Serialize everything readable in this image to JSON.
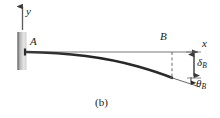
{
  "figure": {
    "caption": "(b)",
    "type": "engineering-beam-deflection-diagram",
    "colors": {
      "beam": "#2b2b2b",
      "axis": "#4d4d4d",
      "wall_dark": "#8c8c8c",
      "wall_light": "#e2e2e2",
      "text": "#1a1a1a",
      "background": "#ffffff"
    },
    "labels": {
      "y_axis": "y",
      "x_axis": "x",
      "point_a": "A",
      "point_b": "B",
      "deflection_symbol": "δ",
      "deflection_subscript": "B",
      "slope_symbol": "θ",
      "slope_subscript": "B"
    },
    "geometry": {
      "wall_x": 22,
      "beam_start_x": 26,
      "beam_start_y": 52,
      "beam_end_x": 172,
      "beam_end_y": 78,
      "axis_line_end_x": 200,
      "dimension_line_x": 194,
      "deflection_top_y": 52,
      "deflection_bottom_y": 78
    }
  }
}
